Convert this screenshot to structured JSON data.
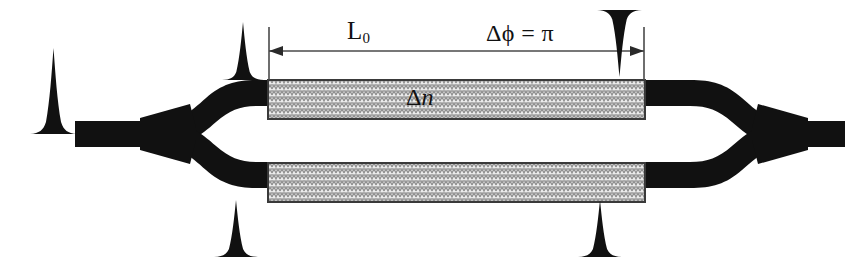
{
  "figure": {
    "kind": "mach-zehnder-interferometer-diagram",
    "background_color": "#ffffff",
    "waveguide_color": "#111111",
    "electrode_fill_color": "#e3e3e3",
    "electrode_border_color": "#3a3a3a",
    "dimension_line_color": "#4a4a4a"
  },
  "labels": {
    "length": "L",
    "length_subscript": "0",
    "phase_shift": "Δϕ = π",
    "index_change_delta": "Δ",
    "index_change_n": "n"
  },
  "pulses": [
    {
      "name": "input-pulse",
      "orientation": "up",
      "position": "left-input"
    },
    {
      "name": "upper-arm-input-pulse",
      "orientation": "up",
      "position": "top-left"
    },
    {
      "name": "upper-arm-output-pulse",
      "orientation": "down",
      "position": "top-right"
    },
    {
      "name": "lower-arm-input-pulse",
      "orientation": "up",
      "position": "bottom-left"
    },
    {
      "name": "lower-arm-output-pulse",
      "orientation": "up",
      "position": "bottom-right"
    }
  ]
}
